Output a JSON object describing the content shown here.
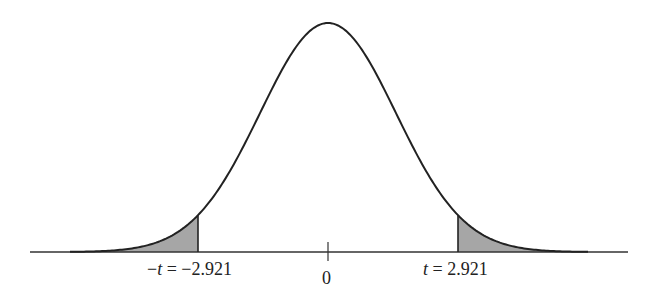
{
  "diagram": {
    "type": "t-distribution two-tailed critical region",
    "labels": {
      "left": {
        "minus": "−",
        "var": "t",
        "rest": " = −2.921"
      },
      "center": "0",
      "right": {
        "var": "t",
        "rest": " = 2.921"
      }
    },
    "critical_value": 2.921,
    "colors": {
      "curve": "#222222",
      "axis": "#333333",
      "shade": "#a6a6a6",
      "text": "#222222"
    },
    "geometry": {
      "axis_y": 252,
      "axis_x0": 30,
      "axis_x1": 628,
      "center_x": 328,
      "peak_y": 23,
      "sigma_px": 68,
      "left_cut_x": 198,
      "right_cut_x": 458,
      "tick_top": 242,
      "tick_bottom": 261
    }
  }
}
